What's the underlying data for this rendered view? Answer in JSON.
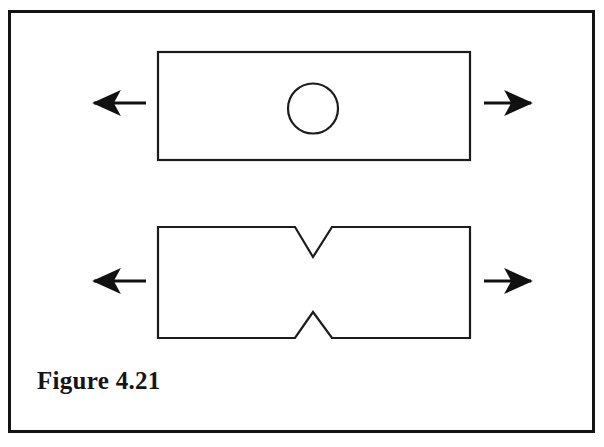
{
  "figure": {
    "caption": "Figure 4.21",
    "frame": {
      "border_color": "#141414",
      "background_color": "#ffffff",
      "border_width_px": 3,
      "x": 8,
      "y": 10,
      "width": 587,
      "height": 423
    },
    "stroke_color": "#1c1c1c",
    "arrow_color": "#111111",
    "specimens": [
      {
        "name": "plate-with-circular-hole",
        "label": "Plate with central circular hole",
        "shape": "rectangle",
        "x": 158,
        "y": 52,
        "width": 312,
        "height": 108,
        "stroke_width": 2,
        "feature": {
          "name": "circular-hole",
          "type": "circle",
          "cx": 313,
          "cy": 108,
          "r": 25,
          "stroke_width": 2
        },
        "load_arrows": [
          {
            "name": "left-load-arrow",
            "direction": "left",
            "x_start": 146,
            "x_end": 92,
            "y": 103
          },
          {
            "name": "right-load-arrow",
            "direction": "right",
            "x_start": 484,
            "x_end": 533,
            "y": 103
          }
        ]
      },
      {
        "name": "plate-with-v-notches",
        "label": "Plate with opposing V-notches",
        "shape": "notched-bar",
        "x": 158,
        "y": 227,
        "width": 312,
        "height": 111,
        "stroke_width": 2,
        "feature": {
          "name": "v-notch-pair",
          "type": "v-notch",
          "notch_center_x": 313,
          "notch_mouth_left_x": 295,
          "notch_mouth_right_x": 332,
          "top_notch_apex_y": 257,
          "bottom_notch_apex_y": 312
        },
        "load_arrows": [
          {
            "name": "left-load-arrow",
            "direction": "left",
            "x_start": 146,
            "x_end": 92,
            "y": 281
          },
          {
            "name": "right-load-arrow",
            "direction": "right",
            "x_start": 484,
            "x_end": 533,
            "y": 281
          }
        ]
      }
    ]
  }
}
